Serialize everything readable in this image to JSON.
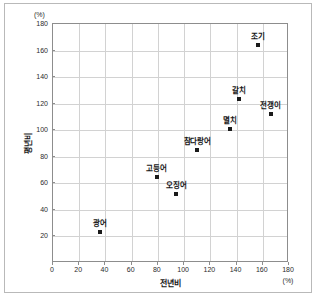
{
  "chart_data": {
    "type": "scatter",
    "title": "",
    "xlabel": "전년비",
    "ylabel": "평년비",
    "x_unit": "(%)",
    "y_unit": "(%)",
    "xlim": [
      0,
      180
    ],
    "ylim": [
      0,
      180
    ],
    "xticks": [
      0,
      20,
      40,
      60,
      80,
      100,
      120,
      140,
      160,
      180
    ],
    "yticks": [
      20,
      40,
      60,
      80,
      100,
      120,
      140,
      160,
      180
    ],
    "grid": true,
    "legend": "none",
    "marker_color": "#1a1a1a",
    "points": [
      {
        "label": "광어",
        "x": 36,
        "y": 23
      },
      {
        "label": "고등어",
        "x": 79,
        "y": 64.5
      },
      {
        "label": "오징어",
        "x": 94,
        "y": 52
      },
      {
        "label": "참다랑어",
        "x": 110,
        "y": 85
      },
      {
        "label": "멸치",
        "x": 135,
        "y": 101
      },
      {
        "label": "갈치",
        "x": 142,
        "y": 123.5
      },
      {
        "label": "조기",
        "x": 156,
        "y": 164
      },
      {
        "label": "전갱이",
        "x": 166,
        "y": 112
      }
    ]
  }
}
